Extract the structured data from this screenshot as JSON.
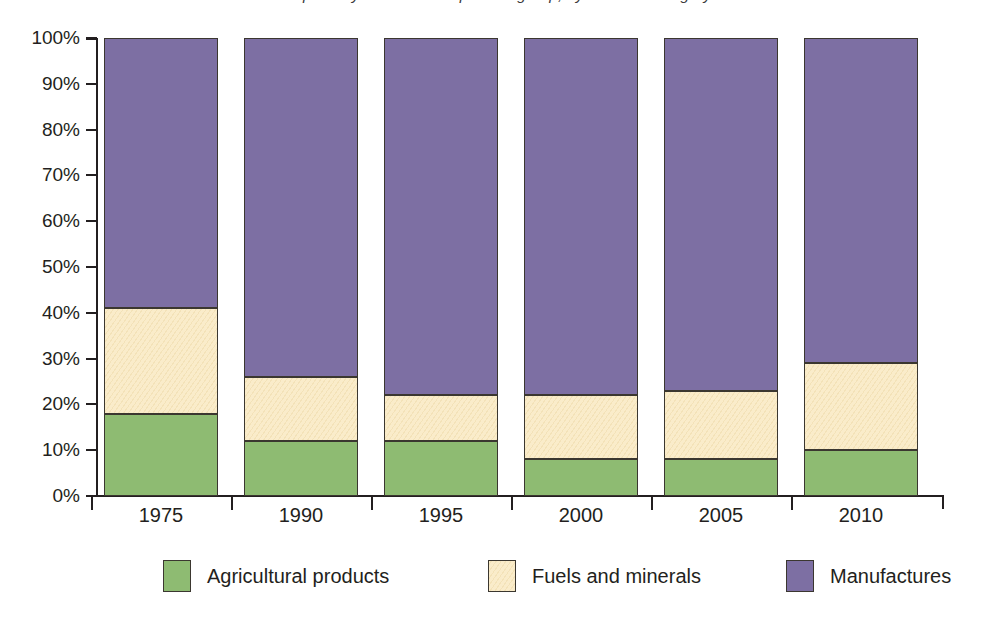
{
  "chart_data": {
    "type": "bar",
    "subtype": "stacked-100-percent",
    "title": "Exports by merchandise product group, by share of category",
    "xlabel": "",
    "ylabel": "",
    "ylim": [
      0,
      100
    ],
    "y_unit": "%",
    "grid": false,
    "legend_position": "bottom",
    "categories": [
      "1975",
      "1990",
      "1995",
      "2000",
      "2005",
      "2010"
    ],
    "y_ticks": [
      "0%",
      "10%",
      "20%",
      "30%",
      "40%",
      "50%",
      "60%",
      "70%",
      "80%",
      "90%",
      "100%"
    ],
    "y_tick_values": [
      0,
      10,
      20,
      30,
      40,
      50,
      60,
      70,
      80,
      90,
      100
    ],
    "series": [
      {
        "name": "Agricultural products",
        "color": "#8ebb72",
        "values": [
          18,
          12,
          12,
          8,
          8,
          10
        ]
      },
      {
        "name": "Fuels and minerals",
        "color": "#faecca",
        "values": [
          23,
          14,
          10,
          14,
          15,
          19
        ]
      },
      {
        "name": "Manufactures",
        "color": "#7d6fa3",
        "values": [
          59,
          74,
          78,
          78,
          77,
          71
        ]
      }
    ]
  },
  "legend": {
    "items": [
      {
        "label": "Agricultural products",
        "color": "#8ebb72"
      },
      {
        "label": "Fuels and minerals",
        "color": "#faecca"
      },
      {
        "label": "Manufactures",
        "color": "#7d6fa3"
      }
    ]
  },
  "colors": {
    "agricultural": "#8ebb72",
    "fuels_minerals": "#faecca",
    "manufactures": "#7d6fa3",
    "axis": "#231f20",
    "outline": "#3b3730",
    "background": "#ffffff"
  }
}
